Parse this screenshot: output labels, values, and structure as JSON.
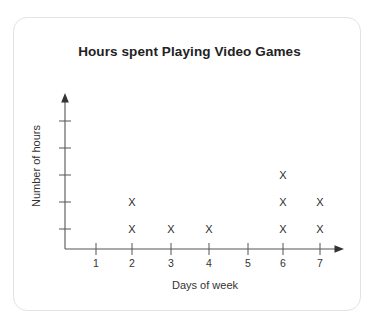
{
  "card": {
    "border_color": "#e3e3e3",
    "background": "#ffffff"
  },
  "chart_data": {
    "type": "scatter",
    "plot_style": "dot-plot-with-x-markers",
    "title": "Hours spent Playing Video Games",
    "xlabel": "Days of week",
    "ylabel": "Number of hours",
    "marker": "X",
    "grid": false,
    "legend": null,
    "x_tick_labels": [
      "1",
      "2",
      "3",
      "4",
      "5",
      "6",
      "7"
    ],
    "y_tick_labels": [
      "",
      "",
      "",
      "",
      ""
    ],
    "y_tick_count": 5,
    "xlim": [
      0.4,
      7.6
    ],
    "ylim": [
      0,
      5.5
    ],
    "categories": [
      "1",
      "2",
      "3",
      "4",
      "5",
      "6",
      "7"
    ],
    "values": [
      0,
      2,
      1,
      1,
      0,
      3,
      2
    ],
    "points": [
      {
        "x": 2,
        "y": 1
      },
      {
        "x": 2,
        "y": 2
      },
      {
        "x": 3,
        "y": 1
      },
      {
        "x": 4,
        "y": 1
      },
      {
        "x": 6,
        "y": 1
      },
      {
        "x": 6,
        "y": 2
      },
      {
        "x": 6,
        "y": 3
      },
      {
        "x": 7,
        "y": 1
      },
      {
        "x": 7,
        "y": 2
      }
    ],
    "axis_color": "#555555",
    "marker_color": "#2b2b2b"
  }
}
